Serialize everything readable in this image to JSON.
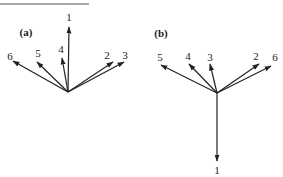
{
  "figure": {
    "panels": [
      {
        "id": "a",
        "label": "(a)",
        "label_pos": [
          26,
          36
        ],
        "origin": [
          68,
          92
        ],
        "vectors": [
          {
            "name": "1",
            "tip": [
              69,
              27
            ],
            "label_pos": [
              69,
              21
            ]
          },
          {
            "name": "6",
            "tip": [
              13,
              61
            ],
            "label_pos": [
              10,
              60
            ]
          },
          {
            "name": "5",
            "tip": [
              37,
              62
            ],
            "label_pos": [
              38,
              57
            ]
          },
          {
            "name": "4",
            "tip": [
              62,
              58
            ],
            "label_pos": [
              61,
              53
            ]
          },
          {
            "name": "2",
            "tip": [
              113,
              62
            ],
            "label_pos": [
              107,
              59
            ]
          },
          {
            "name": "3",
            "tip": [
              124,
              62
            ],
            "label_pos": [
              125,
              59
            ]
          }
        ]
      },
      {
        "id": "b",
        "label": "(b)",
        "label_pos": [
          161,
          37
        ],
        "origin": [
          217,
          93
        ],
        "vectors": [
          {
            "name": "1",
            "tip": [
              217,
              161
            ],
            "label_pos": [
              217,
              174
            ]
          },
          {
            "name": "5",
            "tip": [
              161,
              65
            ],
            "label_pos": [
              160,
              61
            ]
          },
          {
            "name": "4",
            "tip": [
              189,
              64
            ],
            "label_pos": [
              188,
              60
            ]
          },
          {
            "name": "3",
            "tip": [
              210,
              64
            ],
            "label_pos": [
              210,
              61
            ]
          },
          {
            "name": "2",
            "tip": [
              259,
              64
            ],
            "label_pos": [
              256,
              60
            ]
          },
          {
            "name": "6",
            "tip": [
              271,
              66
            ],
            "label_pos": [
              275,
              61
            ]
          }
        ]
      }
    ],
    "top_rule": {
      "x1": 0,
      "x2": 89,
      "y": 4
    },
    "stroke_color": "#222222"
  }
}
